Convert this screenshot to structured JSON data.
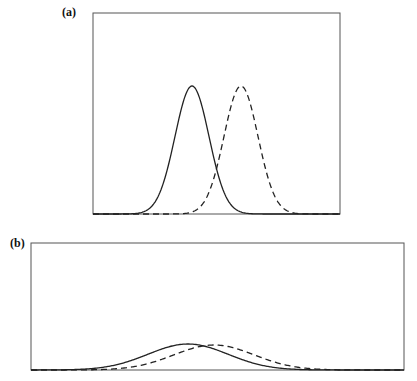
{
  "panels": [
    {
      "id": "a",
      "label": "(a)",
      "box": {
        "x": 93,
        "y": 13,
        "w": 247,
        "h": 201
      },
      "curves": [
        {
          "name": "solid-gaussian",
          "style": "solid",
          "center": 192,
          "sigma": 17,
          "peak_y": 86
        },
        {
          "name": "dashed-gaussian",
          "style": "dashed",
          "center": 241,
          "sigma": 17,
          "peak_y": 86
        }
      ]
    },
    {
      "id": "b",
      "label": "(b)",
      "box": {
        "x": 31,
        "y": 243,
        "w": 373,
        "h": 127
      },
      "curves": [
        {
          "name": "solid-gaussian",
          "style": "solid",
          "center": 188,
          "sigma": 40,
          "peak_y": 344
        },
        {
          "name": "dashed-gaussian",
          "style": "dashed",
          "center": 214,
          "sigma": 40,
          "peak_y": 345
        }
      ]
    }
  ],
  "colors": {
    "stroke": "#222222",
    "frame": "#555555"
  }
}
